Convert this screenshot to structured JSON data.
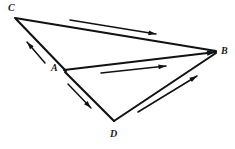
{
  "figure": {
    "background_color": "#ffffff",
    "stroke_color": "#111111",
    "width": 235,
    "height": 149
  },
  "vertices": [
    {
      "id": "C",
      "label": "C",
      "x": 15,
      "y": 17,
      "label_x": 8,
      "label_y": 3
    },
    {
      "id": "B",
      "label": "B",
      "x": 216,
      "y": 52,
      "label_x": 221,
      "label_y": 46
    },
    {
      "id": "A",
      "label": "A",
      "x": 64,
      "y": 70,
      "label_x": 51,
      "label_y": 63
    },
    {
      "id": "D",
      "label": "D",
      "x": 114,
      "y": 122,
      "label_x": 110,
      "label_y": 129
    }
  ],
  "segments": [
    {
      "name": "segment-CB",
      "from": "C",
      "to": "B",
      "x1": 15,
      "y1": 18,
      "x2": 216,
      "y2": 51
    },
    {
      "name": "segment-CA",
      "from": "C",
      "to": "A",
      "x1": 16,
      "y1": 19,
      "x2": 66,
      "y2": 71
    },
    {
      "name": "segment-AB",
      "from": "A",
      "to": "B",
      "x1": 64,
      "y1": 70,
      "x2": 216,
      "y2": 52
    },
    {
      "name": "segment-AD",
      "from": "A",
      "to": "D",
      "x1": 65,
      "y1": 72,
      "x2": 114,
      "y2": 121
    },
    {
      "name": "segment-DB",
      "from": "D",
      "to": "B",
      "x1": 114,
      "y1": 121,
      "x2": 216,
      "y2": 53
    }
  ],
  "direction_arrows": [
    {
      "name": "arrow-C-to-B",
      "label": "C to B",
      "x1": 70,
      "y1": 20,
      "x2": 156,
      "y2": 34
    },
    {
      "name": "arrow-A-to-C",
      "label": "A to C",
      "x1": 45,
      "y1": 63,
      "x2": 27,
      "y2": 42
    },
    {
      "name": "arrow-A-to-B",
      "label": "A to B",
      "x1": 101,
      "y1": 73,
      "x2": 166,
      "y2": 66
    },
    {
      "name": "arrow-A-to-D",
      "label": "A to D",
      "x1": 68,
      "y1": 84,
      "x2": 91,
      "y2": 108
    },
    {
      "name": "arrow-D-to-B",
      "label": "D to B",
      "x1": 138,
      "y1": 112,
      "x2": 197,
      "y2": 76
    }
  ],
  "main_arrowheads": [
    {
      "name": "arrowhead-at-B-from-A",
      "x": 216,
      "y": 52
    }
  ]
}
